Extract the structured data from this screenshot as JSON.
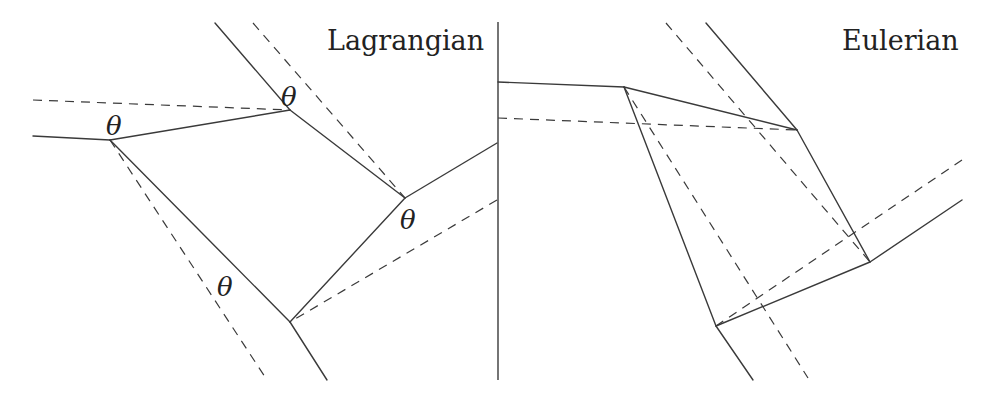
{
  "panels": [
    {
      "title": "Lagrangian",
      "title_pos": [
        327,
        50
      ],
      "solid_lines": [
        [
          33,
          136,
          110,
          140
        ],
        [
          110,
          140,
          290,
          110
        ],
        [
          215,
          23,
          290,
          110
        ],
        [
          290,
          110,
          405,
          198
        ],
        [
          405,
          198,
          497,
          143
        ],
        [
          405,
          198,
          290,
          322
        ],
        [
          290,
          322,
          110,
          140
        ],
        [
          290,
          322,
          327,
          380
        ]
      ],
      "dashed_lines": [
        [
          33,
          100,
          290,
          110
        ],
        [
          253,
          23,
          405,
          198
        ],
        [
          497,
          200,
          290,
          322
        ],
        [
          110,
          140,
          267,
          380
        ]
      ],
      "labels": [
        {
          "text": "θ",
          "x": 106,
          "y": 135
        },
        {
          "text": "θ",
          "x": 281,
          "y": 106
        },
        {
          "text": "θ",
          "x": 400,
          "y": 229
        },
        {
          "text": "θ",
          "x": 217,
          "y": 296
        }
      ]
    },
    {
      "title": "Eulerian",
      "title_pos": [
        842,
        50
      ],
      "solid_lines": [
        [
          498,
          82,
          624,
          87
        ],
        [
          624,
          87,
          797,
          130
        ],
        [
          706,
          23,
          797,
          130
        ],
        [
          797,
          130,
          870,
          262
        ],
        [
          870,
          262,
          962,
          200
        ],
        [
          870,
          262,
          716,
          326
        ],
        [
          624,
          87,
          716,
          326
        ],
        [
          716,
          326,
          753,
          380
        ]
      ],
      "dashed_lines": [
        [
          498,
          118,
          797,
          130
        ],
        [
          666,
          23,
          870,
          262
        ],
        [
          962,
          160,
          716,
          326
        ],
        [
          624,
          87,
          808,
          378
        ]
      ],
      "labels": []
    }
  ],
  "divider": {
    "x": 498,
    "y1": 22,
    "y2": 380
  },
  "colors": {
    "line": "#3a3a3a",
    "text": "#222222",
    "background": "#ffffff"
  }
}
